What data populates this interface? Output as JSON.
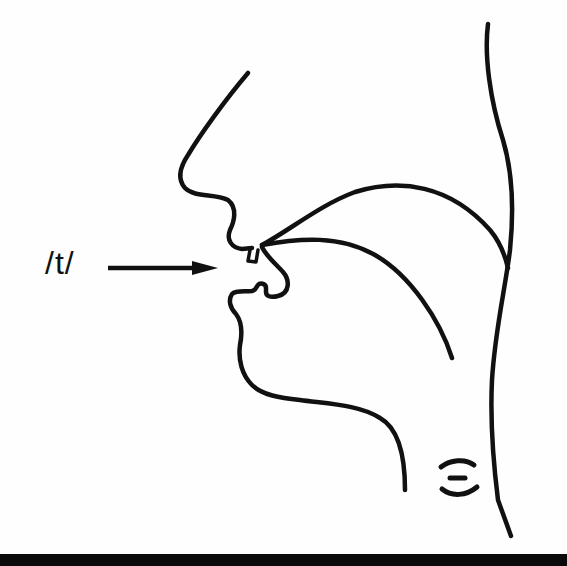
{
  "diagram": {
    "type": "articulatory-sagittal-section",
    "phoneme_label": "/t/",
    "pointer": "arrow pointing to alveolar ridge / tongue tip contact",
    "parts": [
      "nose-profile",
      "upper-lip",
      "upper-teeth",
      "hard-palate-velum",
      "tongue",
      "lower-lip",
      "lower-teeth",
      "chin-jaw",
      "pharynx-wall",
      "voicing-symbol"
    ],
    "voicing_symbol": "vibration-lines",
    "colors": {
      "stroke": "#111111",
      "background": "#fefefe",
      "bottom_bar": "#0a0a0a"
    }
  }
}
